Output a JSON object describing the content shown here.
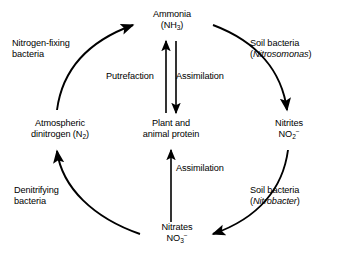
{
  "diagram": {
    "background_color": "#ffffff",
    "stroke_color": "#000000",
    "text_color": "#000000"
  },
  "nodes": {
    "ammonia": {
      "name": "Ammonia",
      "formula_pre": "(NH",
      "formula_sub": "3",
      "formula_post": ")"
    },
    "nitrites": {
      "name": "Nitrites",
      "formula_pre": "NO",
      "formula_sub": "2",
      "formula_sup": "−"
    },
    "nitrates": {
      "name": "Nitrates",
      "formula_pre": "NO",
      "formula_sub": "3",
      "formula_sup": "−"
    },
    "dinitrogen": {
      "line1": "Atmospheric",
      "line2_pre": "dinitrogen (N",
      "line2_sub": "2",
      "line2_post": ")"
    },
    "protein": {
      "line1": "Plant and",
      "line2": "animal protein"
    }
  },
  "processes": {
    "nitrogen_fixing": {
      "line1": "Nitrogen-fixing",
      "line2": "bacteria"
    },
    "nitrosomonas": {
      "line1": "Soil bacteria",
      "line2_open": "(",
      "line2_italic": "Nitrosomonas",
      "line2_close": ")"
    },
    "denitrifying": {
      "line1": "Denitrifying",
      "line2": "bacteria"
    },
    "nitrobacter": {
      "line1": "Soil bacteria",
      "line2_open": "(",
      "line2_italic": "Nitrobacter",
      "line2_close": ")"
    },
    "putrefaction": {
      "label": "Putrefaction"
    },
    "assimilation_upper": {
      "label": "Assimilation"
    },
    "assimilation_lower": {
      "label": "Assimilation"
    }
  },
  "arrows": [
    {
      "id": "arc-dinitrogen-to-ammonia",
      "from": "dinitrogen",
      "to": "ammonia",
      "kind": "arc",
      "direction": "clockwise"
    },
    {
      "id": "arc-ammonia-to-nitrites",
      "from": "ammonia",
      "to": "nitrites",
      "kind": "arc",
      "direction": "clockwise"
    },
    {
      "id": "arc-nitrites-to-nitrates",
      "from": "nitrites",
      "to": "nitrates",
      "kind": "arc",
      "direction": "clockwise"
    },
    {
      "id": "arc-nitrates-to-dinitrogen",
      "from": "nitrates",
      "to": "dinitrogen",
      "kind": "arc",
      "direction": "clockwise"
    },
    {
      "id": "line-protein-to-ammonia",
      "from": "protein",
      "to": "ammonia",
      "kind": "straight",
      "direction": "up"
    },
    {
      "id": "line-ammonia-to-protein",
      "from": "ammonia",
      "to": "protein",
      "kind": "straight",
      "direction": "down"
    },
    {
      "id": "line-nitrates-to-protein",
      "from": "nitrates",
      "to": "protein",
      "kind": "straight",
      "direction": "up"
    }
  ]
}
